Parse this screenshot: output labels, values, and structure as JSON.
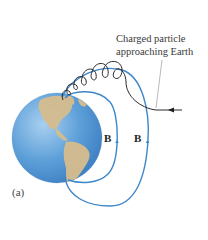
{
  "figure": {
    "caption_line1": "Charged particle",
    "caption_line2": "approaching Earth",
    "field_label_inner": "B",
    "field_label_outer": "B",
    "part_label": "(a)"
  },
  "elements": {
    "earth": "globe showing the Americas",
    "field_lines": [
      "inner magnetic field line",
      "outer magnetic field line"
    ],
    "particle_path": "helical spiral trajectory along field line",
    "incoming_arrow": "arrow pointing left toward Earth"
  },
  "colors": {
    "field_line": "#3b87c9",
    "ocean": "#5a9fd6",
    "land": "#d2b98c",
    "particle_path": "#2a2a2a",
    "pointer_line": "#9a9a9a"
  }
}
